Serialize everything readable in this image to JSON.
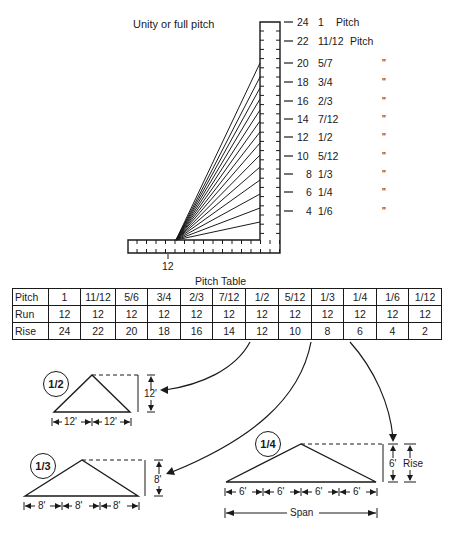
{
  "square_diagram": {
    "title": "Unity or full pitch",
    "run_label": "12",
    "scale": [
      {
        "rise": "24",
        "pitch": "1",
        "suffix": "Pitch"
      },
      {
        "rise": "22",
        "pitch": "11/12",
        "suffix": "Pitch"
      },
      {
        "rise": "20",
        "pitch": "5/7",
        "suffix": "\""
      },
      {
        "rise": "18",
        "pitch": "3/4",
        "suffix": "\""
      },
      {
        "rise": "16",
        "pitch": "2/3",
        "suffix": "\""
      },
      {
        "rise": "14",
        "pitch": "7/12",
        "suffix": "\""
      },
      {
        "rise": "12",
        "pitch": "1/2",
        "suffix": "\""
      },
      {
        "rise": "10",
        "pitch": "5/12",
        "suffix": "\""
      },
      {
        "rise": "8",
        "pitch": "1/3",
        "suffix": "\""
      },
      {
        "rise": "6",
        "pitch": "1/4",
        "suffix": "\""
      },
      {
        "rise": "4",
        "pitch": "1/6",
        "suffix": "\""
      }
    ]
  },
  "pitch_table": {
    "title": "Pitch Table",
    "rows": [
      {
        "header": "Pitch",
        "values": [
          "1",
          "11/12",
          "5/6",
          "3/4",
          "2/3",
          "7/12",
          "1/2",
          "5/12",
          "1/3",
          "1/4",
          "1/6",
          "1/12"
        ]
      },
      {
        "header": "Run",
        "values": [
          "12",
          "12",
          "12",
          "12",
          "12",
          "12",
          "12",
          "12",
          "12",
          "12",
          "12",
          "12"
        ]
      },
      {
        "header": "Rise",
        "values": [
          "24",
          "22",
          "20",
          "18",
          "16",
          "14",
          "12",
          "10",
          "8",
          "6",
          "4",
          "2"
        ]
      }
    ]
  },
  "examples": {
    "half": {
      "badge": "1/2",
      "rise": "12'",
      "segments": [
        "12'",
        "12'"
      ]
    },
    "third": {
      "badge": "1/3",
      "rise": "8'",
      "segments": [
        "8'",
        "8'",
        "8'"
      ]
    },
    "quarter": {
      "badge": "1/4",
      "rise": "6'",
      "rise_label": "Rise",
      "segments": [
        "6'",
        "6'",
        "6'",
        "6'"
      ],
      "span_label": "Span"
    }
  }
}
